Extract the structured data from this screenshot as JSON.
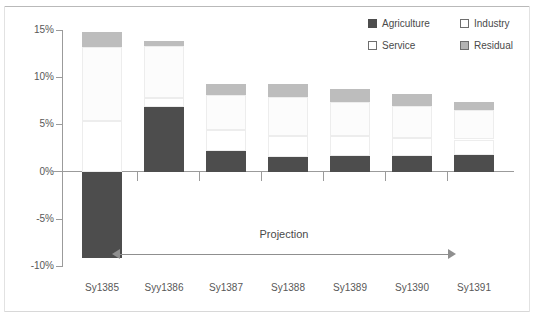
{
  "chart_data": {
    "type": "bar",
    "subtype": "stacked-bar-with-negative",
    "title": "",
    "xlabel": "",
    "ylabel": "",
    "categories": [
      "Sy1385",
      "Syy1386",
      "Sy1387",
      "Sy1388",
      "Sy1389",
      "Sy1390",
      "Sy1391"
    ],
    "ylim": [
      -10,
      15
    ],
    "yticks": [
      15,
      10,
      5,
      0,
      -5,
      -10
    ],
    "ytick_labels": [
      "15%",
      "10%",
      "5%",
      "0%",
      "-5%",
      "-10%"
    ],
    "grid": false,
    "legend_position": "top-right",
    "series": [
      {
        "name": "Agriculture",
        "color": "#4d4d4d",
        "values": [
          -9.2,
          6.8,
          2.2,
          1.5,
          1.6,
          1.6,
          1.8
        ]
      },
      {
        "name": "Industry",
        "color": "#ffffff",
        "values": [
          5.4,
          1.0,
          2.2,
          2.3,
          2.2,
          2.0,
          1.6
        ]
      },
      {
        "name": "Service",
        "color": "#fcfcfc",
        "values": [
          7.8,
          5.5,
          3.7,
          4.1,
          3.6,
          3.4,
          3.1
        ]
      },
      {
        "name": "Residual",
        "color": "#bdbdbd",
        "values": [
          1.6,
          0.5,
          1.2,
          1.4,
          1.3,
          1.2,
          0.9
        ]
      }
    ],
    "totals_positive": [
      14.8,
      13.8,
      9.3,
      9.3,
      8.7,
      8.2,
      7.4
    ],
    "annotations": [
      {
        "text": "Projection",
        "type": "double-arrow",
        "from_category": "Syy1386",
        "to_category": "Sy1391"
      }
    ]
  },
  "legend": {
    "items": [
      {
        "label": "Agriculture",
        "color": "#4d4d4d",
        "border": "#4d4d4d"
      },
      {
        "label": "Industry",
        "color": "#ffffff",
        "border": "#6e6e6e"
      },
      {
        "label": "Service",
        "color": "#ffffff",
        "border": "#6e6e6e"
      },
      {
        "label": "Residual",
        "color": "#b4b4b4",
        "border": "#6e6e6e"
      }
    ]
  },
  "axis": {
    "y_labels": [
      "15%",
      "10%",
      "5%",
      "0%",
      "-5%",
      "-10%"
    ],
    "x_labels": [
      "Sy1385",
      "Syy1386",
      "Sy1387",
      "Sy1388",
      "Sy1389",
      "Sy1390",
      "Sy1391"
    ]
  },
  "annotation": {
    "projection_label": "Projection"
  },
  "colors": {
    "agriculture": "#4d4d4d",
    "industry": "#ffffff",
    "service": "#fcfcfc",
    "residual": "#bdbdbd",
    "axis": "#9b9b9b",
    "text": "#585858"
  }
}
